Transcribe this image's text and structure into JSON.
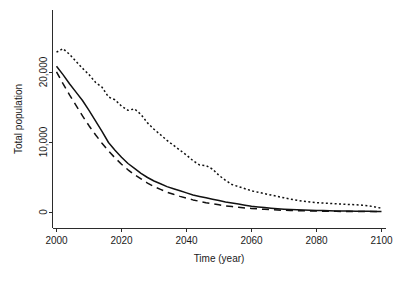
{
  "chart_data": {
    "type": "line",
    "title": "",
    "xlabel": "Time (year)",
    "ylabel": "Total population",
    "xlim": [
      2000,
      2100
    ],
    "ylim": [
      0,
      24000
    ],
    "grid": false,
    "legend": "none",
    "xticks": [
      "2000",
      "2020",
      "2040",
      "2060",
      "2080",
      "2100"
    ],
    "xtick_values": [
      2000,
      2020,
      2040,
      2060,
      2080,
      2100
    ],
    "yticks": [
      "0",
      "10,000",
      "20,000"
    ],
    "ytick_values": [
      0,
      10000,
      20000
    ],
    "x": [
      2000,
      2002,
      2004,
      2006,
      2008,
      2010,
      2012,
      2014,
      2016,
      2018,
      2020,
      2022,
      2024,
      2026,
      2028,
      2030,
      2032,
      2034,
      2036,
      2038,
      2040,
      2042,
      2044,
      2046,
      2048,
      2050,
      2052,
      2054,
      2056,
      2058,
      2060,
      2062,
      2064,
      2066,
      2068,
      2070,
      2072,
      2074,
      2076,
      2078,
      2080,
      2082,
      2084,
      2086,
      2088,
      2090,
      2092,
      2094,
      2096,
      2098,
      2100
    ],
    "series": [
      {
        "name": "upper-bound",
        "style": "dotted",
        "values": [
          22900,
          23400,
          22600,
          21600,
          20600,
          19700,
          18600,
          17900,
          16500,
          16100,
          15200,
          14600,
          14800,
          14000,
          12800,
          11900,
          11100,
          10300,
          9600,
          8900,
          8200,
          7400,
          6800,
          6700,
          6200,
          5300,
          4600,
          4000,
          3700,
          3400,
          3100,
          2900,
          2700,
          2500,
          2300,
          2100,
          1900,
          1750,
          1600,
          1500,
          1400,
          1350,
          1300,
          1250,
          1200,
          1150,
          1100,
          1050,
          950,
          800,
          600
        ]
      },
      {
        "name": "median",
        "style": "solid",
        "values": [
          20900,
          19700,
          18400,
          17200,
          16000,
          14600,
          13100,
          11600,
          10000,
          8900,
          7900,
          7000,
          6300,
          5600,
          5000,
          4500,
          4100,
          3700,
          3400,
          3100,
          2800,
          2500,
          2300,
          2100,
          1900,
          1700,
          1500,
          1350,
          1200,
          1050,
          900,
          800,
          700,
          620,
          550,
          480,
          430,
          390,
          350,
          320,
          290,
          270,
          250,
          230,
          220,
          200,
          190,
          180,
          170,
          160,
          150
        ]
      },
      {
        "name": "lower-bound",
        "style": "dashed",
        "values": [
          20100,
          18400,
          16800,
          15300,
          13800,
          12400,
          11100,
          9900,
          8800,
          7800,
          6900,
          6100,
          5400,
          4800,
          4200,
          3700,
          3300,
          2900,
          2600,
          2300,
          2050,
          1800,
          1600,
          1400,
          1250,
          1100,
          950,
          850,
          750,
          650,
          580,
          510,
          450,
          400,
          360,
          320,
          290,
          260,
          240,
          220,
          200,
          185,
          175,
          165,
          155,
          150,
          145,
          140,
          135,
          130,
          125
        ]
      }
    ]
  },
  "axes": {
    "x_axis_label": "Time (year)",
    "y_axis_label": "Total population"
  }
}
